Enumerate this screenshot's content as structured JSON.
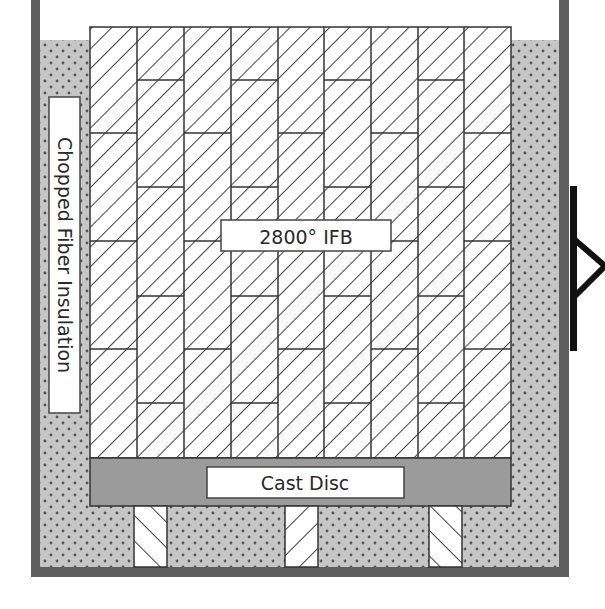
{
  "diagram": {
    "type": "kiln-cross-section",
    "labels": {
      "wall": "2800° IFB",
      "base": "Cast Disc",
      "insulation": "Chopped Fiber Insulation"
    },
    "components": [
      {
        "name": "outer-shell",
        "description": "steel shell (left, right, bottom walls)"
      },
      {
        "name": "insulation",
        "description": "Chopped Fiber Insulation (stippled fill)"
      },
      {
        "name": "brick-wall",
        "description": "2800° IFB stacked brick wall, 9 columns, staggered joints"
      },
      {
        "name": "cast-disc",
        "description": "Cast Disc base slab"
      },
      {
        "name": "support-legs",
        "count": 3
      },
      {
        "name": "hinge-handle",
        "description": "right side handle/hinge bracket"
      }
    ],
    "colors": {
      "shell": "#5f5f5f",
      "insulation_bg": "#c6c6c6",
      "insulation_dot": "#555555",
      "hatch": "#444444",
      "brick_bg": "#ffffff",
      "joint": "#333333",
      "cast_disc": "#9b9b9b",
      "handle": "#111111",
      "label_bg": "#ffffff",
      "label_border": "#444444"
    }
  }
}
